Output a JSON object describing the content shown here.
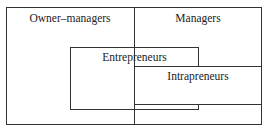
{
  "diagram": {
    "type": "venn-like overlapping rectangles",
    "regions": {
      "owner_managers": {
        "label": "Owner–managers"
      },
      "managers": {
        "label": "Managers"
      },
      "entrepreneurs": {
        "label": "Entrepreneurs"
      },
      "intrapreneurs": {
        "label": "Intrapreneurs"
      }
    },
    "line_color": "#333333",
    "background_color": "#ffffff"
  }
}
